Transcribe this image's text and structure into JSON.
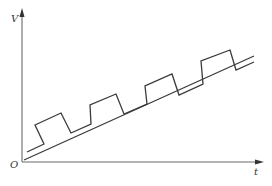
{
  "diagram": {
    "type": "voltage-time graph",
    "axes": {
      "y_label": "V",
      "x_label": "t",
      "origin_label": "O"
    },
    "series": [
      {
        "name": "ramp-baseline",
        "description": "straight line rising linearly with time",
        "points": [
          [
            24,
            160
          ],
          [
            254,
            56
          ]
        ]
      },
      {
        "name": "pulse-train-on-ramp",
        "description": "square-wave pulses superimposed on a rising ramp",
        "pulse_count": 4
      }
    ],
    "colors": {
      "axis": "#6a6a6a",
      "trace": "#3a3a3a",
      "background": "#ffffff"
    }
  }
}
